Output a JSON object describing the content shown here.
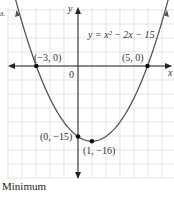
{
  "chart_data": {
    "type": "line",
    "title": "",
    "equation": "y = x² − 2x − 15",
    "xlabel": "x",
    "ylabel": "y",
    "origin_label": "0",
    "grid": true,
    "xlim": [
      -5,
      7
    ],
    "ylim": [
      -20,
      15
    ],
    "function": {
      "a": 1,
      "b": -2,
      "c": -15
    },
    "points": [
      {
        "x": -3,
        "y": 0,
        "label": "(−3, 0)"
      },
      {
        "x": 5,
        "y": 0,
        "label": "(5, 0)"
      },
      {
        "x": 0,
        "y": -15,
        "label": "(0, −15)"
      },
      {
        "x": 1,
        "y": -16,
        "label": "(1, −16)"
      }
    ],
    "caption": "Minimum",
    "part_label": "a."
  },
  "style": {
    "curve_color": "#555555",
    "axis_color": "#222222",
    "grid_color": "#d8d8d8",
    "point_color": "#111111"
  }
}
